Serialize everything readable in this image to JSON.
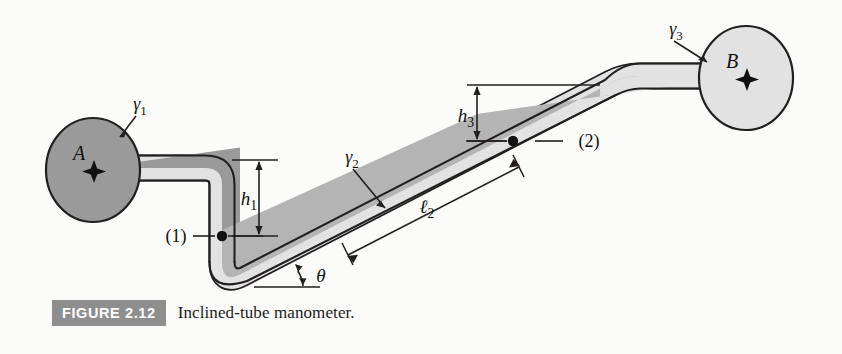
{
  "figure": {
    "tag": "FIGURE 2.12",
    "caption": "Inclined-tube manometer.",
    "tag_bg": "#8e8e8e"
  },
  "diagram": {
    "reservoirs": [
      {
        "id": "A",
        "label": "A",
        "fluid_label": "γ1",
        "fill": "#9a9a9a"
      },
      {
        "id": "B",
        "label": "B",
        "fluid_label": "γ3",
        "fill": "#e2e2e2"
      }
    ],
    "fluid_labels": {
      "gamma1": "γ1",
      "gamma2": "γ2",
      "gamma3": "γ3"
    },
    "point_labels": {
      "point1": "(1)",
      "point2": "(2)"
    },
    "dimensions": {
      "h1": "h1",
      "h3": "h3",
      "l2": "ℓ2",
      "theta": "θ"
    },
    "colors": {
      "fluid_dark": "#9a9a9a",
      "fluid_mid": "#b4b4b4",
      "fluid_light": "#e2e2e2",
      "outline": "#231f20",
      "page": "#fbfbfa"
    }
  }
}
